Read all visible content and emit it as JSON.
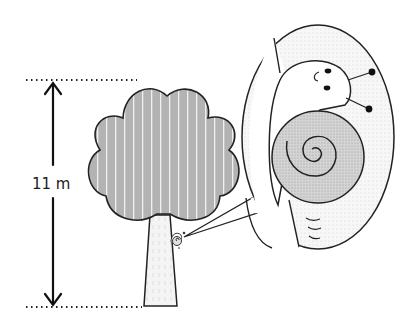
{
  "diagram": {
    "height_label": "11 m",
    "detail_subject": "snail",
    "colors": {
      "outline": "#222222",
      "crown_fill": "#b3b3b3",
      "trunk_fill": "#f2f2f2",
      "shell_fill": "#d0d0d0",
      "bubble_fill": "#f4f4f4"
    }
  }
}
